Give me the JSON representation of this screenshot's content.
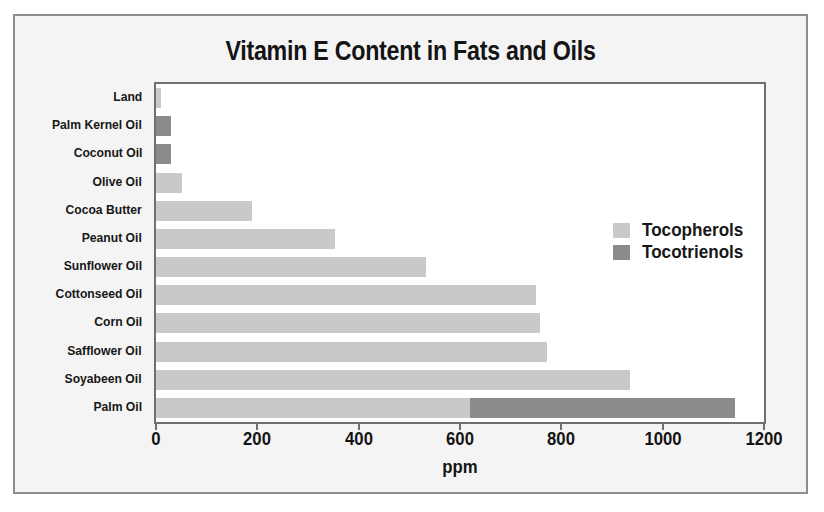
{
  "chart_data": {
    "type": "bar",
    "orientation": "horizontal",
    "stacked": true,
    "title": "Vitamin E Content in Fats and Oils",
    "xlabel": "ppm",
    "ylabel": "",
    "xlim": [
      0,
      1200
    ],
    "xticks": [
      0,
      200,
      400,
      600,
      800,
      1000,
      1200
    ],
    "xtick_labels": [
      "0",
      "200",
      "400",
      "600",
      "800",
      "1000",
      "1200"
    ],
    "grid": false,
    "legend_position": "center-right",
    "categories": [
      "Land",
      "Palm Kernel Oil",
      "Coconut Oil",
      "Olive Oil",
      "Cocoa Butter",
      "Peanut Oil",
      "Sunflower Oil",
      "Cottonseed Oil",
      "Corn  Oil",
      "Safflower Oil",
      "Soyabeen Oil",
      "Palm Oil"
    ],
    "series": [
      {
        "name": "Tocopherols",
        "color": "#c9c9c9",
        "values": [
          10,
          0,
          0,
          51,
          190,
          354,
          533,
          750,
          758,
          772,
          935,
          620
        ]
      },
      {
        "name": "Tocotrienols",
        "color": "#8b8b8b",
        "values": [
          0,
          30,
          30,
          0,
          0,
          0,
          0,
          0,
          0,
          0,
          0,
          522
        ]
      }
    ],
    "totals": [
      10,
      30,
      30,
      51,
      190,
      354,
      533,
      750,
      758,
      772,
      935,
      1142
    ]
  },
  "legend": {
    "entries": [
      {
        "label": "Tocopherols",
        "swatch": "tocopherols"
      },
      {
        "label": "Tocotrienols",
        "swatch": "tocotrienols"
      }
    ]
  },
  "colors": {
    "tocopherols": "#c9c9c9",
    "tocotrienols": "#8b8b8b",
    "frame": "#8d8d8d",
    "axis": "#6f6f6f",
    "text": "#141414",
    "page_background": "#f4f4f4",
    "plot_background": "#ffffff"
  }
}
